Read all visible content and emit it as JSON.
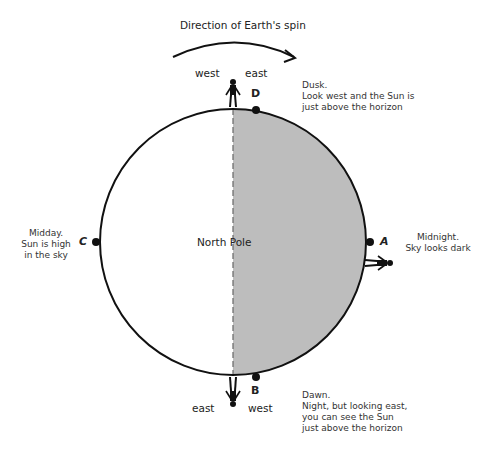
{
  "title": "Direction of Earth's spin",
  "center_label": "North Pole",
  "colors": {
    "night_fill": "#bdbdbd",
    "day_fill": "#ffffff",
    "outline": "#111111"
  },
  "points": {
    "A": {
      "letter": "A",
      "caption_lines": [
        "Midnight.",
        "Sky looks dark"
      ]
    },
    "B": {
      "letter": "B",
      "caption_lines": [
        "Dawn.",
        "Night, but looking east,",
        "you can see the Sun",
        "just above the horizon"
      ],
      "left_dir": "east",
      "right_dir": "west"
    },
    "C": {
      "letter": "C",
      "caption_lines": [
        "Midday.",
        "Sun is high",
        "in the sky"
      ]
    },
    "D": {
      "letter": "D",
      "caption_lines": [
        "Dusk.",
        "Look west and the Sun is",
        "just above the horizon"
      ],
      "left_dir": "west",
      "right_dir": "east"
    }
  }
}
